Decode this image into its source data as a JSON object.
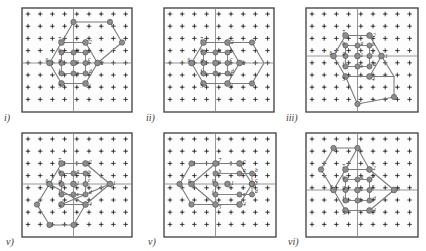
{
  "figure": {
    "type": "lattice-diagram-grid",
    "width": 426,
    "height": 251,
    "background": "#ffffff",
    "rows": 2,
    "cols": 3
  },
  "style": {
    "line_color": "#7b7b7b",
    "node_color": "#8d8d8d",
    "node_stroke": "#4f4f4f",
    "axis_color": "#8a8a8a",
    "frame_color": "#4a4a4a",
    "marker_color": "#2b2b2b",
    "label_color": "#1a1a1a"
  },
  "panels": [
    {
      "id": "panel-i",
      "label": "i)",
      "label_pos": [
        4,
        112
      ],
      "frame": [
        22,
        8,
        110,
        104
      ],
      "lattice": {
        "cols": 9,
        "rows": 8,
        "spacing": 12.2,
        "origin": [
          28,
          14
        ]
      },
      "axes": {
        "vx": 73.5,
        "hy": 63.0
      },
      "outer_vertices": [
        {
          "name": "1",
          "x": 97.5,
          "y": 63.0,
          "lx": 101,
          "ly": 64.5
        },
        {
          "name": "2",
          "x": 85.5,
          "y": 42.5,
          "lx": 89,
          "ly": 44
        },
        {
          "name": "7",
          "x": 61.5,
          "y": 42.5,
          "lx": 58,
          "ly": 41
        },
        {
          "name": "6",
          "x": 49.5,
          "y": 63.0,
          "lx": 45.5,
          "ly": 62
        },
        {
          "name": "5",
          "x": 61.5,
          "y": 83.5,
          "lx": 58.5,
          "ly": 88
        },
        {
          "name": "4",
          "x": 85.5,
          "y": 83.5,
          "lx": 88,
          "ly": 88
        }
      ],
      "inner_sites": [
        {
          "name": "1",
          "x": 73.5,
          "y": 63.0,
          "lx": 76.5,
          "ly": 63.5
        },
        {
          "name": "a",
          "x": 73.5,
          "y": 52.5,
          "lx": 76.5,
          "ly": 52
        },
        {
          "name": "b",
          "x": 85.5,
          "y": 52.5,
          "lx": 88,
          "ly": 52.5
        },
        {
          "name": "c",
          "x": 85.5,
          "y": 63.0,
          "lx": 88,
          "ly": 61
        },
        {
          "name": "d",
          "x": 85.5,
          "y": 73.5,
          "lx": 89,
          "ly": 73
        },
        {
          "name": "e",
          "x": 73.5,
          "y": 73.5,
          "lx": 76.5,
          "ly": 75
        },
        {
          "name": "f",
          "x": 61.5,
          "y": 73.5,
          "lx": 58.5,
          "ly": 73
        },
        {
          "name": "g",
          "x": 61.5,
          "y": 63.0,
          "lx": 58.5,
          "ly": 62
        },
        {
          "name": "h",
          "x": 61.5,
          "y": 52.5,
          "lx": 58,
          "ly": 52
        }
      ],
      "extra_nodes": [
        {
          "x": 73.5,
          "y": 22.0
        },
        {
          "x": 110.0,
          "y": 22.0
        },
        {
          "x": 122.0,
          "y": 42.5
        }
      ],
      "extra_paths": [
        "M73.5,22 L110,22 L122,42.5 L97.5,63",
        "M73.5,22 L61.5,42.5"
      ]
    },
    {
      "id": "panel-ii",
      "label": "ii)",
      "label_pos": [
        146,
        112
      ],
      "frame": [
        164,
        8,
        110,
        104
      ],
      "lattice": {
        "cols": 9,
        "rows": 8,
        "spacing": 12.2,
        "origin": [
          170,
          14
        ]
      },
      "axes": {
        "vx": 215.5,
        "hy": 63.0
      },
      "outer_vertices": [
        {
          "name": "1",
          "x": 239.5,
          "y": 63.0,
          "lx": 243,
          "ly": 64.5
        },
        {
          "name": "2",
          "x": 227.5,
          "y": 42.5,
          "lx": 231,
          "ly": 44
        },
        {
          "name": "7",
          "x": 203.5,
          "y": 42.5,
          "lx": 200,
          "ly": 41
        },
        {
          "name": "6",
          "x": 191.5,
          "y": 63.0,
          "lx": 187.5,
          "ly": 62
        },
        {
          "name": "5",
          "x": 203.5,
          "y": 83.5,
          "lx": 200.5,
          "ly": 88
        },
        {
          "name": "4",
          "x": 227.5,
          "y": 83.5,
          "lx": 230,
          "ly": 88
        }
      ],
      "inner_sites": [
        {
          "name": "1",
          "x": 215.5,
          "y": 63.0,
          "lx": 218.5,
          "ly": 63.5
        },
        {
          "name": "a",
          "x": 215.5,
          "y": 52.5,
          "lx": 218.5,
          "ly": 52
        },
        {
          "name": "b",
          "x": 227.5,
          "y": 52.5,
          "lx": 230,
          "ly": 52.5
        },
        {
          "name": "c",
          "x": 227.5,
          "y": 63.0,
          "lx": 230,
          "ly": 61
        },
        {
          "name": "d",
          "x": 227.5,
          "y": 73.5,
          "lx": 231,
          "ly": 73
        },
        {
          "name": "e",
          "x": 215.5,
          "y": 73.5,
          "lx": 218.5,
          "ly": 75
        },
        {
          "name": "f",
          "x": 203.5,
          "y": 73.5,
          "lx": 200.5,
          "ly": 73
        },
        {
          "name": "g",
          "x": 203.5,
          "y": 63.0,
          "lx": 200.5,
          "ly": 62
        },
        {
          "name": "h",
          "x": 203.5,
          "y": 52.5,
          "lx": 200,
          "ly": 52
        }
      ],
      "extra_nodes": [
        {
          "x": 252.0,
          "y": 42.5
        },
        {
          "x": 252.0,
          "y": 83.5
        }
      ],
      "extra_paths": [
        "M227.5,42.5 L252,42.5 L264,63 L252,83.5 L227.5,83.5"
      ]
    },
    {
      "id": "panel-iii",
      "label": "iii)",
      "label_pos": [
        286,
        112
      ],
      "frame": [
        306,
        8,
        112,
        104
      ],
      "lattice": {
        "cols": 9,
        "rows": 8,
        "spacing": 12.2,
        "origin": [
          312,
          14
        ]
      },
      "axes": {
        "vx": 357.5,
        "hy": 56.0
      },
      "outer_vertices": [
        {
          "name": "1",
          "x": 381.5,
          "y": 56.0,
          "lx": 385,
          "ly": 57.5
        },
        {
          "name": "2",
          "x": 369.5,
          "y": 35.5,
          "lx": 373,
          "ly": 37
        },
        {
          "name": "7",
          "x": 345.5,
          "y": 35.5,
          "lx": 342,
          "ly": 34
        },
        {
          "name": "6",
          "x": 333.5,
          "y": 56.0,
          "lx": 329.5,
          "ly": 55
        },
        {
          "name": "5",
          "x": 345.5,
          "y": 76.5,
          "lx": 342.5,
          "ly": 81
        },
        {
          "name": "4",
          "x": 369.5,
          "y": 76.5,
          "lx": 372,
          "ly": 81
        }
      ],
      "inner_sites": [
        {
          "name": "1",
          "x": 357.5,
          "y": 56.0,
          "lx": 360.5,
          "ly": 56.5
        },
        {
          "name": "a",
          "x": 357.5,
          "y": 45.5,
          "lx": 360.5,
          "ly": 45
        },
        {
          "name": "b",
          "x": 369.5,
          "y": 45.5,
          "lx": 372,
          "ly": 45.5
        },
        {
          "name": "c",
          "x": 369.5,
          "y": 56.0,
          "lx": 372,
          "ly": 54
        },
        {
          "name": "d",
          "x": 369.5,
          "y": 66.5,
          "lx": 373,
          "ly": 66
        },
        {
          "name": "e",
          "x": 357.5,
          "y": 66.5,
          "lx": 360.5,
          "ly": 68
        },
        {
          "name": "f",
          "x": 345.5,
          "y": 66.5,
          "lx": 342.5,
          "ly": 66
        },
        {
          "name": "g",
          "x": 345.5,
          "y": 56.0,
          "lx": 342.5,
          "ly": 55
        },
        {
          "name": "h",
          "x": 345.5,
          "y": 45.5,
          "lx": 342,
          "ly": 45
        }
      ],
      "extra_nodes": [
        {
          "x": 357.5,
          "y": 104.0
        },
        {
          "x": 394.0,
          "y": 97.0
        }
      ],
      "extra_paths": [
        "M369.5,76.5 L394,76.5 L394,97 L357.5,104 L345.5,76.5",
        "M381.5,56 L394,76.5"
      ]
    },
    {
      "id": "panel-iv",
      "label": "v)",
      "label_pos": [
        6,
        236
      ],
      "frame": [
        22,
        133,
        110,
        104
      ],
      "lattice": {
        "cols": 9,
        "rows": 8,
        "spacing": 12.2,
        "origin": [
          28,
          139
        ]
      },
      "axes": {
        "vx": 73.5,
        "hy": 184.0
      },
      "outer_vertices": [
        {
          "name": "1",
          "x": 110.0,
          "y": 184.0,
          "lx": 113,
          "ly": 185
        },
        {
          "name": "2",
          "x": 85.5,
          "y": 163.5,
          "lx": 89,
          "ly": 164
        },
        {
          "name": "7",
          "x": 61.5,
          "y": 163.5,
          "lx": 58,
          "ly": 162
        },
        {
          "name": "6",
          "x": 49.5,
          "y": 184.0,
          "lx": 45.5,
          "ly": 183
        },
        {
          "name": "4",
          "x": 85.5,
          "y": 204.5,
          "lx": 89,
          "ly": 206
        },
        {
          "name": "5",
          "x": 61.5,
          "y": 204.5,
          "lx": 58.5,
          "ly": 209
        }
      ],
      "inner_sites": [
        {
          "name": "1",
          "x": 73.5,
          "y": 184.0,
          "lx": 76.5,
          "ly": 184.5
        },
        {
          "name": "a",
          "x": 73.5,
          "y": 173.5,
          "lx": 76.5,
          "ly": 173
        },
        {
          "name": "b",
          "x": 85.5,
          "y": 173.5,
          "lx": 88,
          "ly": 173.5
        },
        {
          "name": "c",
          "x": 85.5,
          "y": 184.0,
          "lx": 88,
          "ly": 182
        },
        {
          "name": "d",
          "x": 85.5,
          "y": 194.5,
          "lx": 89,
          "ly": 194
        },
        {
          "name": "e",
          "x": 73.5,
          "y": 194.5,
          "lx": 76.5,
          "ly": 196
        },
        {
          "name": "f",
          "x": 61.5,
          "y": 194.5,
          "lx": 58.5,
          "ly": 194
        },
        {
          "name": "g",
          "x": 61.5,
          "y": 184.0,
          "lx": 58.5,
          "ly": 183
        },
        {
          "name": "h",
          "x": 61.5,
          "y": 173.5,
          "lx": 58,
          "ly": 173
        }
      ],
      "extra_nodes": [
        {
          "x": 37.0,
          "y": 204.5
        },
        {
          "x": 49.5,
          "y": 225.0
        },
        {
          "x": 73.5,
          "y": 225.0
        }
      ],
      "extra_paths": [
        "M49.5,184 L37,204.5 L49.5,225 L73.5,225 L85.5,204.5",
        "M110,184 L85.5,204.5"
      ]
    },
    {
      "id": "panel-v",
      "label": "v)",
      "label_pos": [
        148,
        236
      ],
      "frame": [
        164,
        133,
        112,
        104
      ],
      "lattice": {
        "cols": 9,
        "rows": 8,
        "spacing": 12.2,
        "origin": [
          170,
          139
        ]
      },
      "axes": {
        "vx": 215.5,
        "hy": 184.0
      },
      "outer_vertices": [
        {
          "name": "3",
          "x": 252.0,
          "y": 184.0,
          "lx": 255,
          "ly": 185
        },
        {
          "name": "2",
          "x": 239.5,
          "y": 163.5,
          "lx": 243,
          "ly": 164
        },
        {
          "name": "7",
          "x": 215.5,
          "y": 163.5,
          "lx": 218.5,
          "ly": 162
        },
        {
          "name": "6",
          "x": 191.5,
          "y": 184.0,
          "lx": 188,
          "ly": 183
        },
        {
          "name": "5",
          "x": 215.5,
          "y": 204.5,
          "lx": 218.5,
          "ly": 209
        },
        {
          "name": "4",
          "x": 239.5,
          "y": 204.5,
          "lx": 243,
          "ly": 206
        }
      ],
      "inner_sites": [
        {
          "name": "1",
          "x": 227.5,
          "y": 184.0,
          "lx": 231,
          "ly": 184.5
        },
        {
          "name": "a",
          "x": 239.5,
          "y": 173.5,
          "lx": 243,
          "ly": 172
        },
        {
          "name": "b",
          "x": 252.0,
          "y": 173.5,
          "lx": 255,
          "ly": 172
        },
        {
          "name": "c",
          "x": 252.0,
          "y": 184.0,
          "lx": 255,
          "ly": 182
        },
        {
          "name": "d",
          "x": 252.0,
          "y": 194.5,
          "lx": 255,
          "ly": 193
        },
        {
          "name": "e",
          "x": 239.5,
          "y": 194.5,
          "lx": 243,
          "ly": 196
        },
        {
          "name": "f",
          "x": 215.5,
          "y": 194.5,
          "lx": 212,
          "ly": 194
        },
        {
          "name": "g",
          "x": 215.5,
          "y": 184.0,
          "lx": 212,
          "ly": 182
        },
        {
          "name": "h",
          "x": 215.5,
          "y": 173.5,
          "lx": 218.5,
          "ly": 173
        }
      ],
      "extra_nodes": [
        {
          "x": 191.5,
          "y": 163.5
        },
        {
          "x": 179.5,
          "y": 184.0
        },
        {
          "x": 191.5,
          "y": 204.5
        }
      ],
      "extra_paths": [
        "M215.5,163.5 L191.5,163.5 L179.5,184 L191.5,204.5 L215.5,204.5"
      ]
    },
    {
      "id": "panel-vi",
      "label": "vi)",
      "label_pos": [
        288,
        236
      ],
      "frame": [
        306,
        133,
        112,
        104
      ],
      "lattice": {
        "cols": 9,
        "rows": 8,
        "spacing": 12.2,
        "origin": [
          312,
          139
        ]
      },
      "axes": {
        "vx": 357.5,
        "hy": 190.0
      },
      "outer_vertices": [
        {
          "name": "3",
          "x": 394.0,
          "y": 190.0,
          "lx": 397,
          "ly": 191
        },
        {
          "name": "2",
          "x": 369.5,
          "y": 169.5,
          "lx": 373,
          "ly": 170
        },
        {
          "name": "7",
          "x": 345.5,
          "y": 169.5,
          "lx": 342,
          "ly": 168
        },
        {
          "name": "6",
          "x": 333.5,
          "y": 190.0,
          "lx": 330,
          "ly": 189
        },
        {
          "name": "5",
          "x": 345.5,
          "y": 210.5,
          "lx": 342.5,
          "ly": 215
        },
        {
          "name": "4",
          "x": 369.5,
          "y": 210.5,
          "lx": 373,
          "ly": 212
        }
      ],
      "inner_sites": [
        {
          "name": "1",
          "x": 357.5,
          "y": 190.0,
          "lx": 360.5,
          "ly": 190.5
        },
        {
          "name": "a",
          "x": 357.5,
          "y": 179.5,
          "lx": 360.5,
          "ly": 179
        },
        {
          "name": "b",
          "x": 369.5,
          "y": 179.5,
          "lx": 372,
          "ly": 178
        },
        {
          "name": "c",
          "x": 369.5,
          "y": 190.0,
          "lx": 372,
          "ly": 188
        },
        {
          "name": "d",
          "x": 369.5,
          "y": 200.5,
          "lx": 373,
          "ly": 200
        },
        {
          "name": "e",
          "x": 357.5,
          "y": 200.5,
          "lx": 360.5,
          "ly": 202
        },
        {
          "name": "f",
          "x": 345.5,
          "y": 200.5,
          "lx": 342.5,
          "ly": 200
        },
        {
          "name": "g",
          "x": 345.5,
          "y": 190.0,
          "lx": 342.5,
          "ly": 189
        },
        {
          "name": "h",
          "x": 345.5,
          "y": 179.5,
          "lx": 342,
          "ly": 179
        }
      ],
      "extra_nodes": [
        {
          "x": 357.5,
          "y": 148.0
        },
        {
          "x": 321.0,
          "y": 169.5
        },
        {
          "x": 333.5,
          "y": 148.0
        }
      ],
      "extra_paths": [
        "M333.5,148 L357.5,148 L369.5,169.5",
        "M333.5,148 L321,169.5 L333.5,190",
        "M345.5,169.5 L357.5,148"
      ]
    }
  ]
}
